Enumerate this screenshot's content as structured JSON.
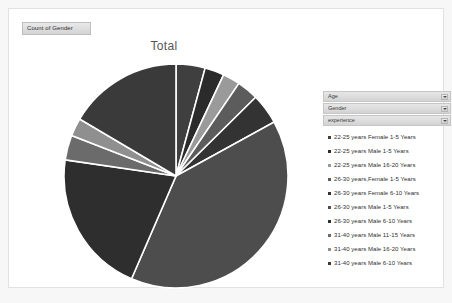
{
  "window": {
    "background": "#f7f7f7",
    "panel_background": "#ffffff",
    "panel_border": "#e2e2e2"
  },
  "field_button": {
    "label": "Count of Gender"
  },
  "slicers": [
    {
      "label": "Age",
      "icon": "chevron-down-icon"
    },
    {
      "label": "Gender",
      "icon": "chevron-down-icon"
    },
    {
      "label": "experience",
      "icon": "chevron-down-icon"
    }
  ],
  "chart_data": {
    "type": "pie",
    "title": "Total",
    "xlabel": "",
    "ylabel": "",
    "legend_position": "right",
    "grid": false,
    "start_angle": 0,
    "direction": "clockwise",
    "categories": [
      "22-25 years Female 1-5 Years",
      "22-25 years Male 1-5 Years",
      "22-25 years Male 16-20 Years",
      "26-30 years,Female 1-5 Years",
      "26-30 years Female 6-10 Years",
      "26-30 years Male 1-5 Years",
      "26-30 years Male 6-10 Years",
      "31-40 years Male 11-15 Years",
      "31-40 years Male 16-20 Years",
      "31-40 years Male 6-10 Years"
    ],
    "values": [
      4.2,
      2.8,
      2.5,
      3.1,
      4.4,
      39.5,
      20.8,
      3.6,
      2.6,
      16.5
    ],
    "colors": [
      "#3f3f3f",
      "#2b2b2b",
      "#9a9a9a",
      "#5c5c5c",
      "#333333",
      "#4d4d4d",
      "#2e2e2e",
      "#6b6b6b",
      "#8f8f8f",
      "#3a3a3a"
    ],
    "slice_separator_color": "#ffffff"
  },
  "legend": {
    "items": [
      {
        "label": "22-25 years Female 1-5 Years",
        "color": "#3f3f3f"
      },
      {
        "label": "22-25 years Male 1-5 Years",
        "color": "#2b2b2b"
      },
      {
        "label": "22-25 years Male 16-20 Years",
        "color": "#9a9a9a"
      },
      {
        "label": "26-30 years,Female 1-5 Years",
        "color": "#5c5c5c"
      },
      {
        "label": "26-30 years Female 6-10 Years",
        "color": "#333333"
      },
      {
        "label": "26-30 years Male 1-5 Years",
        "color": "#4d4d4d"
      },
      {
        "label": "26-30 years Male 6-10 Years",
        "color": "#2e2e2e"
      },
      {
        "label": "31-40 years Male 11-15 Years",
        "color": "#6b6b6b"
      },
      {
        "label": "31-40 years Male 16-20 Years",
        "color": "#8f8f8f"
      },
      {
        "label": "31-40 years Male 6-10 Years",
        "color": "#3a3a3a"
      }
    ]
  }
}
